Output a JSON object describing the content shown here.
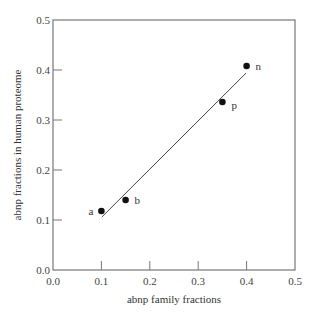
{
  "chart_data": {
    "type": "scatter",
    "title": "",
    "xlabel": "abnp family fractions",
    "ylabel": "abnp fractions in human proteome",
    "xlim": [
      0.0,
      0.5
    ],
    "ylim": [
      0.0,
      0.5
    ],
    "xticks": [
      "0.0",
      "0.1",
      "0.2",
      "0.3",
      "0.4",
      "0.5"
    ],
    "yticks": [
      "0.0",
      "0.1",
      "0.2",
      "0.3",
      "0.4",
      "0.5"
    ],
    "grid": false,
    "legend": null,
    "points": [
      {
        "label": "a",
        "x": 0.1,
        "y": 0.118
      },
      {
        "label": "b",
        "x": 0.15,
        "y": 0.14
      },
      {
        "label": "p",
        "x": 0.35,
        "y": 0.336
      },
      {
        "label": "n",
        "x": 0.4,
        "y": 0.408
      }
    ],
    "fit_line": {
      "x": [
        0.101,
        0.399
      ],
      "y": [
        0.106,
        0.394
      ]
    },
    "colors": {
      "points": "#111111",
      "axis": "#777777",
      "line": "#444444"
    }
  }
}
